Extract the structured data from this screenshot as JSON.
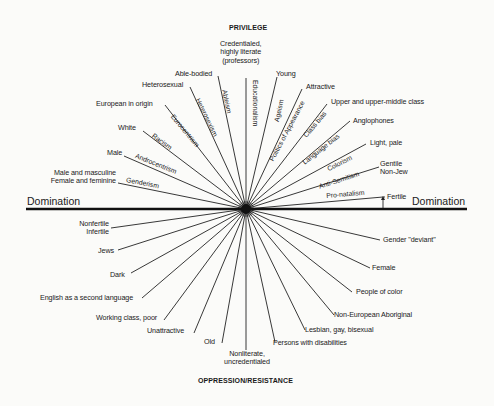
{
  "titles": {
    "top": "PRIVILEGE",
    "bottom": "OPPRESSION/RESISTANCE",
    "domination_left": "Domination",
    "domination_right": "Domination"
  },
  "center": {
    "x": 246,
    "y": 209
  },
  "privilege_labels": {
    "credentialed": [
      "Credentialed,",
      "highly literate",
      "(professors)"
    ],
    "able_bodied": "Able-bodied",
    "heterosexual": "Heterosexual",
    "european": "European in origin",
    "white": "White",
    "male": "Male",
    "gender_normative": [
      "Male and masculine",
      "Female and feminine"
    ],
    "young": "Young",
    "attractive": "Attractive",
    "upper_class": "Upper and upper-middle class",
    "anglophones": "Anglophones",
    "light": "Light, pale",
    "gentile": [
      "Gentile",
      "Non-Jew"
    ],
    "fertile": "Fertile"
  },
  "oppression_labels": {
    "nonfertile": [
      "Nonfertile",
      "Infertile"
    ],
    "jews": "Jews",
    "dark": "Dark",
    "esl": "English as a second language",
    "working_class": "Working class, poor",
    "unattractive": "Unattractive",
    "old": "Old",
    "nonliterate": [
      "Nonliterate,",
      "uncredentialed"
    ],
    "disabilities": "Persons with disabilities",
    "lgb": "Lesbian, gay, bisexual",
    "aboriginal": "Non-European Aboriginal",
    "people_of_color": "People of color",
    "female": "Female",
    "gender_deviant": "Gender \"deviant\""
  },
  "axes": {
    "genderism": "Genderism",
    "androcentrism": "Androcentrism",
    "racism": "Racism",
    "eurocentrism": "Eurocentrism",
    "heterosexism": "Heterosexism",
    "ableism": "Ableism",
    "educationalism": "Educationalism",
    "ageism": "Ageism",
    "appearance": "Politics of Appearance",
    "class_bias": "Class bias",
    "language_bias": "Language bias",
    "colorism": "Colorism",
    "anti_semitism": "Anti-Semitism",
    "pro_natalism": "Pro-natalism"
  },
  "rays": {
    "upper": [
      [
        118,
        183
      ],
      [
        124,
        156
      ],
      [
        143,
        131
      ],
      [
        165,
        105
      ],
      [
        190,
        87
      ],
      [
        218,
        76
      ],
      [
        246,
        78
      ],
      [
        277,
        77
      ],
      [
        302,
        89
      ],
      [
        327,
        104
      ],
      [
        350,
        121
      ],
      [
        366,
        144
      ],
      [
        379,
        167
      ],
      [
        383,
        197
      ]
    ],
    "lower": [
      [
        111,
        228
      ],
      [
        118,
        250
      ],
      [
        131,
        273
      ],
      [
        142,
        298
      ],
      [
        164,
        320
      ],
      [
        194,
        333
      ],
      [
        222,
        343
      ],
      [
        246,
        350
      ],
      [
        275,
        342
      ],
      [
        305,
        330
      ],
      [
        334,
        315
      ],
      [
        352,
        292
      ],
      [
        370,
        268
      ],
      [
        380,
        240
      ]
    ]
  },
  "colors": {
    "ink": "#1a1a1a",
    "paper": "#fbfbf9"
  }
}
